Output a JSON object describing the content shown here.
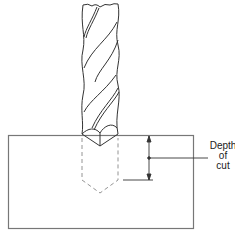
{
  "figure": {
    "annotation": {
      "line1": "Depth",
      "line2": "of",
      "line3": "cut"
    },
    "colors": {
      "stroke": "#333333",
      "workpiece_stroke": "#777777",
      "background": "#ffffff"
    }
  }
}
